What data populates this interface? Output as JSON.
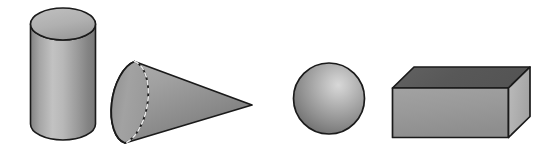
{
  "figure": {
    "title": "Three-dimensional geometric solids",
    "width": 560,
    "height": 153,
    "background_color": "#ffffff",
    "outline_color": "#1a1a1a",
    "shape_count": 4
  },
  "palette": {
    "outline": "#1a1a1a",
    "gray_light": "#c8c8c8",
    "gray_mid": "#a8a8a8",
    "gray_base": "#989898",
    "gray_dark": "#767676",
    "gray_darker": "#5f5f5f",
    "highlight": "#d8d8d8",
    "hidden_edge": "#e8e8e8"
  },
  "shapes": [
    {
      "id": "cylinder",
      "name": "Cylinder",
      "order": 1,
      "bounds": {
        "x": 30,
        "y": 8,
        "width": 66,
        "height": 132
      },
      "faces": [
        "top ellipse",
        "lateral surface"
      ],
      "top_fill": "#b4b4b4",
      "body_fill_light": "#bdbdbd",
      "body_fill_dark": "#7e7e7e",
      "hidden_edges": false
    },
    {
      "id": "cone",
      "name": "Cone",
      "order": 2,
      "bounds": {
        "x": 113,
        "y": 60,
        "width": 139,
        "height": 85
      },
      "apex": {
        "x": 252,
        "y": 105
      },
      "base_center": {
        "x": 136,
        "y": 102
      },
      "faces": [
        "base ellipse",
        "lateral surface"
      ],
      "body_fill_light": "#a5a5a5",
      "body_fill_dark": "#7a7a7a",
      "hidden_edges": true,
      "hidden_edge_style": "dashed"
    },
    {
      "id": "sphere",
      "name": "Sphere",
      "order": 3,
      "bounds": {
        "x": 293,
        "y": 63,
        "width": 72,
        "height": 71
      },
      "center": {
        "x": 329,
        "y": 98
      },
      "radius": 36,
      "highlight_position": {
        "cx": "63%",
        "cy": "31%"
      },
      "body_fill_light": "#d4d4d4",
      "body_fill_dark": "#6e6e6e",
      "hidden_edges": false
    },
    {
      "id": "rectangular-prism",
      "name": "Rectangular prism",
      "order": 4,
      "bounds": {
        "x": 392,
        "y": 66,
        "width": 138,
        "height": 72
      },
      "faces": [
        "top face",
        "front face",
        "right end face"
      ],
      "top_fill": "#5a5a5a",
      "front_fill": "#9a9a9a",
      "side_fill": "#b0b0b0",
      "hidden_edges": false
    }
  ]
}
